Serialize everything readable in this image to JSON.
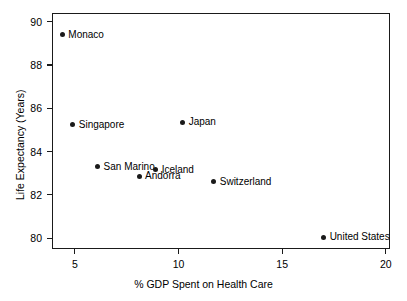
{
  "chart_data": {
    "type": "scatter",
    "title": "",
    "xlabel": "% GDP Spent on Health Care",
    "ylabel": "Life Expectancy (Years)",
    "xlim": [
      3.9,
      20.2
    ],
    "ylim": [
      79.5,
      90.4
    ],
    "xticks": [
      5,
      10,
      15,
      20
    ],
    "xticklabels": [
      "5",
      "10",
      "15",
      "20"
    ],
    "yticks": [
      80,
      82,
      84,
      86,
      88,
      90
    ],
    "yticklabels": [
      "80",
      "82",
      "84",
      "86",
      "88",
      "90"
    ],
    "grid": false,
    "legend": "none",
    "marker_color": "#1a1a1a",
    "points": [
      {
        "label": "Monaco",
        "x": 4.4,
        "y": 89.4,
        "label_pos": "right"
      },
      {
        "label": "Singapore",
        "x": 4.9,
        "y": 85.25,
        "label_pos": "right"
      },
      {
        "label": "San Marino",
        "x": 6.1,
        "y": 83.3,
        "label_pos": "right"
      },
      {
        "label": "Andorra",
        "x": 8.1,
        "y": 82.85,
        "label_pos": "right"
      },
      {
        "label": "Iceland",
        "x": 8.9,
        "y": 83.15,
        "label_pos": "right"
      },
      {
        "label": "Japan",
        "x": 10.2,
        "y": 85.35,
        "label_pos": "right"
      },
      {
        "label": "Switzerland",
        "x": 11.7,
        "y": 82.6,
        "label_pos": "right"
      },
      {
        "label": "United States",
        "x": 17.0,
        "y": 80.05,
        "label_pos": "right"
      }
    ]
  }
}
